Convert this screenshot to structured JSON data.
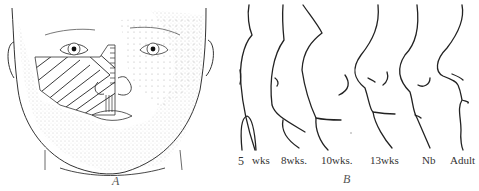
{
  "figure": {
    "panel_a": {
      "label": "A",
      "description": "Frontal view of infant face with hatched regions over left cheek and nose"
    },
    "panel_b": {
      "label": "B",
      "description": "Profile outlines of facial development",
      "stages": [
        {
          "label": "5"
        },
        {
          "label": "wks"
        },
        {
          "label": "8wks."
        },
        {
          "label": "10wks."
        },
        {
          "label": "13wks"
        },
        {
          "label": "Nb"
        },
        {
          "label": "Adult"
        }
      ]
    }
  }
}
